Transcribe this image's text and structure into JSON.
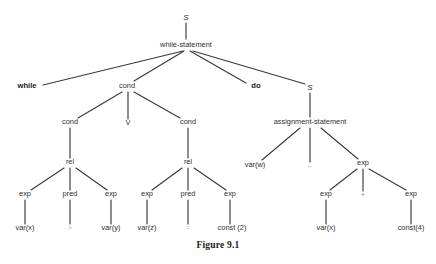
{
  "figure": {
    "caption": "Figure 9.1"
  },
  "colors": {
    "edge": "#3a3a3a",
    "text": "#2e2e2e",
    "terminal": "#1a1a1a",
    "faint": "#b9b9b9",
    "background": "#ffffff"
  },
  "tree": {
    "nodes": [
      {
        "id": "n1",
        "label": "S",
        "x": 186,
        "y": 20,
        "style": "italic-sym",
        "kind": "nonterminal"
      },
      {
        "id": "n2",
        "label": "while-statement",
        "x": 186,
        "y": 47,
        "style": "normal",
        "kind": "nonterminal"
      },
      {
        "id": "n3",
        "label": "while",
        "x": 27,
        "y": 88,
        "style": "terminal-bold",
        "kind": "terminal"
      },
      {
        "id": "n4",
        "label": "cond",
        "x": 127,
        "y": 88,
        "style": "normal",
        "kind": "nonterminal"
      },
      {
        "id": "n5",
        "label": "do",
        "x": 256,
        "y": 88,
        "style": "terminal-bold",
        "kind": "terminal"
      },
      {
        "id": "n6",
        "label": "S",
        "x": 310,
        "y": 90,
        "style": "italic-sym",
        "kind": "nonterminal"
      },
      {
        "id": "n7",
        "label": "cond",
        "x": 70,
        "y": 124,
        "style": "normal",
        "kind": "nonterminal"
      },
      {
        "id": "n8",
        "label": "V",
        "x": 128,
        "y": 125,
        "style": "normal",
        "kind": "terminal"
      },
      {
        "id": "n9",
        "label": "cond",
        "x": 188,
        "y": 124,
        "style": "normal",
        "kind": "nonterminal"
      },
      {
        "id": "n10",
        "label": "assignment-statement",
        "x": 310,
        "y": 124,
        "style": "normal",
        "kind": "nonterminal"
      },
      {
        "id": "n11",
        "label": "rel",
        "x": 70,
        "y": 164,
        "style": "normal",
        "kind": "nonterminal"
      },
      {
        "id": "n12",
        "label": "rel",
        "x": 188,
        "y": 164,
        "style": "normal",
        "kind": "nonterminal"
      },
      {
        "id": "n13",
        "label": "var(w)",
        "x": 255,
        "y": 167,
        "style": "normal",
        "kind": "terminal"
      },
      {
        "id": "n14",
        "label": "←",
        "x": 310,
        "y": 168,
        "style": "midfaint",
        "kind": "terminal"
      },
      {
        "id": "n15",
        "label": "exp",
        "x": 363,
        "y": 165,
        "style": "normal",
        "kind": "nonterminal"
      },
      {
        "id": "n16",
        "label": "exp",
        "x": 25,
        "y": 196,
        "style": "normal",
        "kind": "nonterminal"
      },
      {
        "id": "n17",
        "label": "pred",
        "x": 70,
        "y": 196,
        "style": "normal",
        "kind": "nonterminal"
      },
      {
        "id": "n18",
        "label": "exp",
        "x": 111,
        "y": 196,
        "style": "normal",
        "kind": "nonterminal"
      },
      {
        "id": "n19",
        "label": "exp",
        "x": 147,
        "y": 196,
        "style": "normal",
        "kind": "nonterminal"
      },
      {
        "id": "n20",
        "label": "pred",
        "x": 188,
        "y": 196,
        "style": "normal",
        "kind": "nonterminal"
      },
      {
        "id": "n21",
        "label": "exp",
        "x": 230,
        "y": 196,
        "style": "normal",
        "kind": "nonterminal"
      },
      {
        "id": "n22",
        "label": "exp",
        "x": 326,
        "y": 196,
        "style": "normal",
        "kind": "nonterminal"
      },
      {
        "id": "n23",
        "label": "+",
        "x": 363,
        "y": 197,
        "style": "midfaint",
        "kind": "terminal"
      },
      {
        "id": "n24",
        "label": "exp",
        "x": 411,
        "y": 196,
        "style": "normal",
        "kind": "nonterminal"
      },
      {
        "id": "n25",
        "label": "var(x)",
        "x": 25,
        "y": 230,
        "style": "normal",
        "kind": "terminal"
      },
      {
        "id": "n26",
        "label": ">",
        "x": 70,
        "y": 230,
        "style": "faint",
        "kind": "terminal"
      },
      {
        "id": "n27",
        "label": "var(y)",
        "x": 111,
        "y": 230,
        "style": "normal",
        "kind": "terminal"
      },
      {
        "id": "n28",
        "label": "var(z)",
        "x": 147,
        "y": 230,
        "style": "normal",
        "kind": "terminal"
      },
      {
        "id": "n29",
        "label": "=",
        "x": 188,
        "y": 230,
        "style": "faint2",
        "kind": "terminal"
      },
      {
        "id": "n30",
        "label": "const (2)",
        "x": 232,
        "y": 230,
        "style": "normal",
        "kind": "terminal"
      },
      {
        "id": "n31",
        "label": "var(x)",
        "x": 326,
        "y": 230,
        "style": "normal",
        "kind": "terminal"
      },
      {
        "id": "n32",
        "label": "const(4)",
        "x": 411,
        "y": 230,
        "style": "normal",
        "kind": "terminal"
      }
    ],
    "edges": [
      {
        "from": "n1",
        "to": "n2",
        "x1": 186,
        "y1": 23,
        "x2": 186,
        "y2": 39
      },
      {
        "from": "n2",
        "to": "n3",
        "x1": 183,
        "y1": 51,
        "x2": 43,
        "y2": 85
      },
      {
        "from": "n2",
        "to": "n4",
        "x1": 184,
        "y1": 51,
        "x2": 134,
        "y2": 81
      },
      {
        "from": "n2",
        "to": "n5",
        "x1": 190,
        "y1": 51,
        "x2": 246,
        "y2": 83
      },
      {
        "from": "n2",
        "to": "n6",
        "x1": 193,
        "y1": 51,
        "x2": 305,
        "y2": 84
      },
      {
        "from": "n4",
        "to": "n7",
        "x1": 122,
        "y1": 92,
        "x2": 78,
        "y2": 118
      },
      {
        "from": "n4",
        "to": "n8",
        "x1": 128,
        "y1": 92,
        "x2": 128,
        "y2": 119
      },
      {
        "from": "n4",
        "to": "n9",
        "x1": 134,
        "y1": 92,
        "x2": 180,
        "y2": 118
      },
      {
        "from": "n6",
        "to": "n10",
        "x1": 310,
        "y1": 93,
        "x2": 310,
        "y2": 117
      },
      {
        "from": "n7",
        "to": "n11",
        "x1": 70,
        "y1": 128,
        "x2": 70,
        "y2": 158
      },
      {
        "from": "n9",
        "to": "n12",
        "x1": 188,
        "y1": 128,
        "x2": 188,
        "y2": 158
      },
      {
        "from": "n10",
        "to": "n13",
        "x1": 300,
        "y1": 128,
        "x2": 262,
        "y2": 160
      },
      {
        "from": "n10",
        "to": "n14",
        "x1": 310,
        "y1": 128,
        "x2": 310,
        "y2": 162
      },
      {
        "from": "n10",
        "to": "n15",
        "x1": 321,
        "y1": 128,
        "x2": 358,
        "y2": 159
      },
      {
        "from": "n11",
        "to": "n16",
        "x1": 64,
        "y1": 168,
        "x2": 31,
        "y2": 190
      },
      {
        "from": "n11",
        "to": "n17",
        "x1": 70,
        "y1": 168,
        "x2": 70,
        "y2": 190
      },
      {
        "from": "n11",
        "to": "n18",
        "x1": 76,
        "y1": 168,
        "x2": 107,
        "y2": 190
      },
      {
        "from": "n12",
        "to": "n19",
        "x1": 182,
        "y1": 168,
        "x2": 152,
        "y2": 190
      },
      {
        "from": "n12",
        "to": "n20",
        "x1": 188,
        "y1": 168,
        "x2": 188,
        "y2": 190
      },
      {
        "from": "n12",
        "to": "n21",
        "x1": 194,
        "y1": 168,
        "x2": 226,
        "y2": 190
      },
      {
        "from": "n15",
        "to": "n22",
        "x1": 357,
        "y1": 169,
        "x2": 330,
        "y2": 190
      },
      {
        "from": "n15",
        "to": "n23",
        "x1": 363,
        "y1": 169,
        "x2": 363,
        "y2": 191
      },
      {
        "from": "n15",
        "to": "n24",
        "x1": 369,
        "y1": 169,
        "x2": 406,
        "y2": 190
      },
      {
        "from": "n16",
        "to": "n25",
        "x1": 25,
        "y1": 200,
        "x2": 25,
        "y2": 224
      },
      {
        "from": "n17",
        "to": "n26",
        "x1": 70,
        "y1": 200,
        "x2": 70,
        "y2": 224
      },
      {
        "from": "n18",
        "to": "n27",
        "x1": 111,
        "y1": 200,
        "x2": 111,
        "y2": 224
      },
      {
        "from": "n19",
        "to": "n28",
        "x1": 147,
        "y1": 200,
        "x2": 147,
        "y2": 224
      },
      {
        "from": "n20",
        "to": "n29",
        "x1": 188,
        "y1": 200,
        "x2": 188,
        "y2": 224
      },
      {
        "from": "n21",
        "to": "n30",
        "x1": 230,
        "y1": 200,
        "x2": 230,
        "y2": 224
      },
      {
        "from": "n22",
        "to": "n31",
        "x1": 326,
        "y1": 200,
        "x2": 326,
        "y2": 224
      },
      {
        "from": "n24",
        "to": "n32",
        "x1": 411,
        "y1": 200,
        "x2": 411,
        "y2": 224
      }
    ]
  }
}
